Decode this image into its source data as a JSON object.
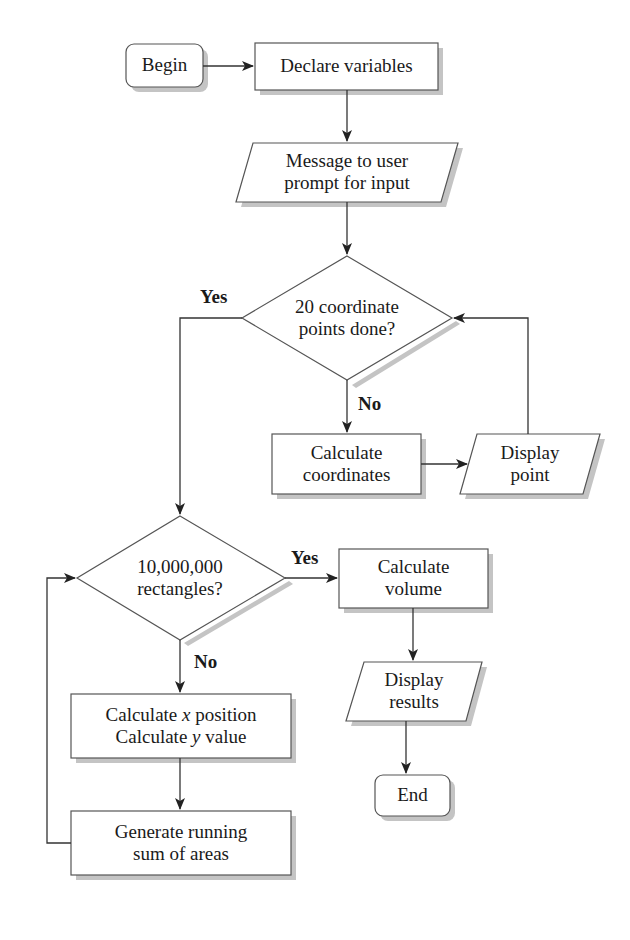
{
  "diagram": {
    "type": "flowchart",
    "colors": {
      "stroke": "#444444",
      "fill": "#ffffff",
      "shadow": "#bdbdbd",
      "text": "#1a1a1a"
    },
    "nodes": {
      "begin": {
        "shape": "terminal",
        "label": "Begin"
      },
      "declare": {
        "shape": "process",
        "label": "Declare variables"
      },
      "prompt": {
        "shape": "io",
        "line1": "Message to user",
        "line2": "prompt for input"
      },
      "decision_points": {
        "shape": "decision",
        "line1": "20 coordinate",
        "line2": "points done?"
      },
      "calc_coords": {
        "shape": "process",
        "line1": "Calculate",
        "line2": "coordinates"
      },
      "display_point": {
        "shape": "io",
        "line1": "Display",
        "line2": "point"
      },
      "decision_rects": {
        "shape": "decision",
        "line1": "10,000,000",
        "line2": "rectangles?"
      },
      "calc_volume": {
        "shape": "process",
        "line1": "Calculate",
        "line2": "volume"
      },
      "display_results": {
        "shape": "io",
        "line1": "Display",
        "line2": "results"
      },
      "end": {
        "shape": "terminal",
        "label": "End"
      },
      "calc_xy": {
        "shape": "process",
        "line1_pre": "Calculate ",
        "line1_var": "x",
        "line1_post": " position",
        "line2_pre": "Calculate ",
        "line2_var": "y",
        "line2_post": " value"
      },
      "running_sum": {
        "shape": "process",
        "line1": "Generate running",
        "line2": "sum of areas"
      }
    },
    "edge_labels": {
      "points_yes": "Yes",
      "points_no": "No",
      "rects_yes": "Yes",
      "rects_no": "No"
    }
  }
}
